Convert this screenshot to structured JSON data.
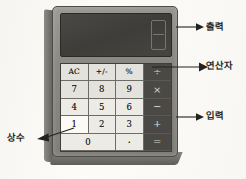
{
  "scene": {
    "title": "Hand-drawn calculator diagram with Korean annotations",
    "background_color": "#fcfbf8"
  },
  "calculator": {
    "body_color": "#8b8984",
    "display": {
      "label": "display",
      "background_color": "#3e3d3a",
      "value": "0",
      "digit_style": "seven-segment"
    },
    "keypad": {
      "key_color": "#e4e2dc",
      "operator_color": "#4a4945",
      "rows": [
        [
          {
            "label": "AC",
            "type": "function",
            "name": "key-ac"
          },
          {
            "label": "+/-",
            "type": "function",
            "name": "key-sign"
          },
          {
            "label": "%",
            "type": "function",
            "name": "key-percent"
          },
          {
            "label": "÷",
            "type": "operator",
            "name": "key-divide"
          }
        ],
        [
          {
            "label": "7",
            "type": "digit",
            "name": "key-7"
          },
          {
            "label": "8",
            "type": "digit",
            "name": "key-8"
          },
          {
            "label": "9",
            "type": "digit",
            "name": "key-9"
          },
          {
            "label": "×",
            "type": "operator",
            "name": "key-multiply"
          }
        ],
        [
          {
            "label": "4",
            "type": "digit",
            "name": "key-4"
          },
          {
            "label": "5",
            "type": "digit",
            "name": "key-5"
          },
          {
            "label": "6",
            "type": "digit",
            "name": "key-6"
          },
          {
            "label": "−",
            "type": "operator",
            "name": "key-minus"
          }
        ],
        [
          {
            "label": "1",
            "type": "digit",
            "name": "key-1",
            "highlighted": true
          },
          {
            "label": "2",
            "type": "digit",
            "name": "key-2"
          },
          {
            "label": "3",
            "type": "digit",
            "name": "key-3"
          },
          {
            "label": "+",
            "type": "operator",
            "name": "key-plus"
          }
        ],
        [
          {
            "label": "0",
            "type": "digit",
            "name": "key-0",
            "wide": true
          },
          {
            "label": ".",
            "type": "digit",
            "name": "key-decimal"
          },
          {
            "label": "=",
            "type": "operator",
            "name": "key-equals"
          }
        ]
      ]
    }
  },
  "annotations": [
    {
      "id": "output",
      "text": "출력",
      "name": "annotation-output",
      "points_to": "display"
    },
    {
      "id": "operator",
      "text": "연산자",
      "name": "annotation-operator",
      "points_to": "operator-column"
    },
    {
      "id": "input",
      "text": "입력",
      "name": "annotation-input",
      "points_to": "keypad"
    },
    {
      "id": "constant",
      "text": "상수",
      "name": "annotation-constant",
      "points_to": "key-1"
    }
  ]
}
